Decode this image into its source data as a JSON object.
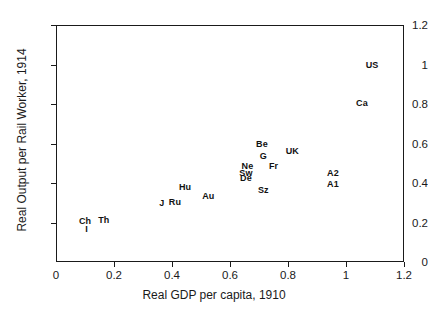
{
  "chart_data": {
    "type": "scatter",
    "title": "",
    "xlabel": "Real GDP per capita, 1910",
    "ylabel": "Real Output per Rail Worker, 1914",
    "xlim": [
      0,
      1.2
    ],
    "ylim": [
      0,
      1.2
    ],
    "xticks": [
      "0",
      "0.2",
      "0.4",
      "0.6",
      "0.8",
      "1",
      "1.2"
    ],
    "xtick_values": [
      0,
      0.2,
      0.4,
      0.6,
      0.8,
      1,
      1.2
    ],
    "yticks": [
      "0",
      "0.2",
      "0.4",
      "0.6",
      "0.8",
      "1",
      "1.2"
    ],
    "ytick_values": [
      0,
      0.2,
      0.4,
      0.6,
      0.8,
      1,
      1.2
    ],
    "grid": false,
    "legend": "none",
    "marker_style": "text-label",
    "points": [
      {
        "label": "Ch",
        "x": 0.1,
        "y": 0.21
      },
      {
        "label": "I",
        "x": 0.105,
        "y": 0.165
      },
      {
        "label": "Th",
        "x": 0.165,
        "y": 0.215
      },
      {
        "label": "J",
        "x": 0.365,
        "y": 0.3
      },
      {
        "label": "Ru",
        "x": 0.41,
        "y": 0.305
      },
      {
        "label": "Hu",
        "x": 0.445,
        "y": 0.38
      },
      {
        "label": "Au",
        "x": 0.525,
        "y": 0.335
      },
      {
        "label": "Ne",
        "x": 0.66,
        "y": 0.485
      },
      {
        "label": "Sw",
        "x": 0.655,
        "y": 0.45
      },
      {
        "label": "De",
        "x": 0.655,
        "y": 0.425
      },
      {
        "label": "Sz",
        "x": 0.715,
        "y": 0.365
      },
      {
        "label": "Be",
        "x": 0.71,
        "y": 0.595
      },
      {
        "label": "G",
        "x": 0.715,
        "y": 0.535
      },
      {
        "label": "Fr",
        "x": 0.75,
        "y": 0.485
      },
      {
        "label": "UK",
        "x": 0.815,
        "y": 0.56
      },
      {
        "label": "A2",
        "x": 0.955,
        "y": 0.45
      },
      {
        "label": "A1",
        "x": 0.955,
        "y": 0.395
      },
      {
        "label": "Ca",
        "x": 1.055,
        "y": 0.805
      },
      {
        "label": "US",
        "x": 1.09,
        "y": 1.0
      }
    ]
  },
  "axes": {
    "x_title": "Real GDP per capita, 1910",
    "y_title": "Real Output per Rail Worker, 1914"
  },
  "colors": {
    "axis": "#1a1a1a",
    "marker": "#111111",
    "background": "#ffffff"
  }
}
